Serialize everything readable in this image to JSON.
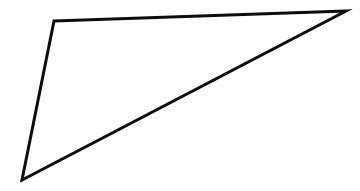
{
  "canvas": {
    "width": 360,
    "height": 191,
    "background_color": "#ffffff"
  },
  "figure": {
    "name": "triangle",
    "shape_type": "triangle",
    "fill_color": "#ffffff",
    "stroke_color": "#0d0d0d",
    "stroke_width": 3,
    "vertices": [
      {
        "label": "top-left",
        "x": 54,
        "y": 21
      },
      {
        "label": "top-right",
        "x": 346,
        "y": 11
      },
      {
        "label": "bottom-left",
        "x": 22,
        "y": 180
      }
    ],
    "path": "M 54 21 L 346 11 L 22 180 Z",
    "edges": [
      {
        "name": "top-edge",
        "from": "top-left",
        "to": "top-right"
      },
      {
        "name": "hypotenuse-edge",
        "from": "top-right",
        "to": "bottom-left"
      },
      {
        "name": "left-edge",
        "from": "bottom-left",
        "to": "top-left"
      }
    ]
  }
}
